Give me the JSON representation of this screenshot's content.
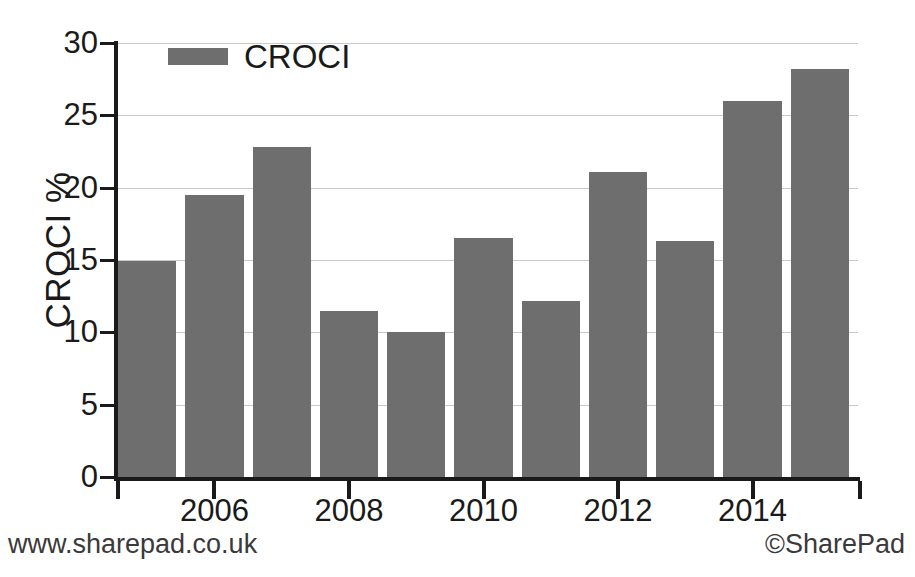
{
  "chart_data": {
    "type": "bar",
    "title": "",
    "xlabel": "",
    "ylabel": "CROCI %",
    "ylim": [
      0,
      30
    ],
    "xlim_categories": [
      "2005",
      "2006",
      "2007",
      "2008",
      "2009",
      "2010",
      "2011",
      "2012",
      "2013",
      "2014",
      "2015"
    ],
    "categories": [
      "2005",
      "2006",
      "2007",
      "2008",
      "2009",
      "2010",
      "2011",
      "2012",
      "2013",
      "2014",
      "2015"
    ],
    "values": [
      14.9,
      19.5,
      22.8,
      11.5,
      10.0,
      16.5,
      12.2,
      21.1,
      16.3,
      26.0,
      28.2
    ],
    "series": [
      {
        "name": "CROCI",
        "values": [
          14.9,
          19.5,
          22.8,
          11.5,
          10.0,
          16.5,
          12.2,
          21.1,
          16.3,
          26.0,
          28.2
        ],
        "color": "#6e6e6e"
      }
    ],
    "y_ticks": [
      0,
      5,
      10,
      15,
      20,
      25,
      30
    ],
    "y_tick_labels": [
      "0",
      "5",
      "10",
      "15",
      "20",
      "25",
      "30"
    ],
    "x_tick_labels": [
      "2006",
      "2008",
      "2010",
      "2012",
      "2014"
    ],
    "x_tick_categories": [
      "2006",
      "2008",
      "2010",
      "2012",
      "2014"
    ],
    "grid": "horizontal",
    "legend_position": "top-left",
    "bar_color": "#6e6e6e",
    "axis_color": "#1a1a1a",
    "gridline_color": "#c9c9c9",
    "background_color": "#ffffff"
  },
  "legend": {
    "entries": [
      {
        "label": "CROCI",
        "color": "#6e6e6e"
      }
    ]
  },
  "axes": {
    "y_title": "CROCI %"
  },
  "footer": {
    "left": "www.sharepad.co.uk",
    "right": "©SharePad"
  }
}
